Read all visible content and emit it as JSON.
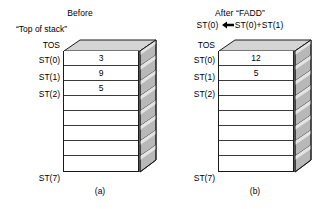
{
  "figure": {
    "caption_a": "(a)",
    "caption_b": "(b)",
    "top_of_stack_note": "“Top of stack”",
    "tos_label_a": "TOS",
    "tos_label_b": "TOS"
  },
  "panel_a": {
    "title": "Before",
    "rows": [
      {
        "label": "ST(0)",
        "value": "3"
      },
      {
        "label": "ST(1)",
        "value": "9"
      },
      {
        "label": "ST(2)",
        "value": "5"
      },
      {
        "label": "",
        "value": ""
      },
      {
        "label": "",
        "value": ""
      },
      {
        "label": "",
        "value": ""
      },
      {
        "label": "",
        "value": ""
      },
      {
        "label": "ST(7)",
        "value": ""
      }
    ]
  },
  "panel_b": {
    "title": "After “FADD”",
    "expression_left": "ST(0)",
    "expression_arrow": "left-arrow",
    "expression_right": "ST(0)+ST(1)",
    "rows": [
      {
        "label": "ST(0)",
        "value": "12"
      },
      {
        "label": "ST(1)",
        "value": "5"
      },
      {
        "label": "ST(2)",
        "value": ""
      },
      {
        "label": "",
        "value": ""
      },
      {
        "label": "",
        "value": ""
      },
      {
        "label": "",
        "value": ""
      },
      {
        "label": "",
        "value": ""
      },
      {
        "label": "ST(7)",
        "value": ""
      }
    ]
  },
  "colors": {
    "background": "#ffffff",
    "ink": "#000000",
    "outline": "#1a1a1a",
    "row_divider": "#3a3a3a",
    "top_face_fill": "#d4d4d4",
    "side_face_fill": "#b0b0b0",
    "side_face_light": "#e8e8e8"
  }
}
